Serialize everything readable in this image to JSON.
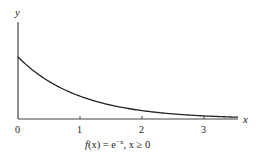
{
  "chart_data": {
    "type": "line",
    "title": "",
    "caption": "f(x) = e^−x, x ≥ 0",
    "xlabel": "x",
    "ylabel": "y",
    "xticks": [
      "0",
      "1",
      "2",
      "3"
    ],
    "xlim": [
      0,
      3.6
    ],
    "ylim": [
      0,
      1.6
    ],
    "grid": false,
    "series": [
      {
        "name": "f(x) = e^-x",
        "x": [
          0,
          0.25,
          0.5,
          0.75,
          1,
          1.25,
          1.5,
          1.75,
          2,
          2.25,
          2.5,
          2.75,
          3,
          3.25,
          3.5
        ],
        "values": [
          1,
          0.779,
          0.607,
          0.472,
          0.368,
          0.287,
          0.223,
          0.174,
          0.135,
          0.105,
          0.082,
          0.064,
          0.05,
          0.039,
          0.03
        ]
      }
    ]
  },
  "labels": {
    "y_axis": "y",
    "x_axis": "x",
    "tick_0": "0",
    "tick_1": "1",
    "tick_2": "2",
    "tick_3": "3",
    "caption_f": "f",
    "caption_x": "(x)",
    "caption_eq": " = e",
    "caption_exp": "−x",
    "caption_rest": ", x ≥ 0"
  }
}
